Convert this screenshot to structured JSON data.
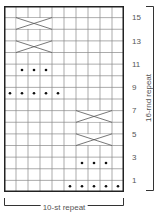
{
  "chart": {
    "columns": 10,
    "rows": 16,
    "grid_color": "#888888",
    "border_color": "#222222",
    "row_labels": [
      "15",
      "13",
      "11",
      "9",
      "7",
      "5",
      "3",
      "1"
    ],
    "purl_symbol": "dot",
    "cable_symbol": "crossing-lines",
    "purls": [
      {
        "row": 11,
        "cols": [
          2,
          3,
          4
        ]
      },
      {
        "row": 9,
        "cols": [
          1,
          2,
          3,
          4,
          5
        ]
      },
      {
        "row": 3,
        "cols": [
          7,
          8,
          9
        ]
      },
      {
        "row": 1,
        "cols": [
          6,
          7,
          8,
          9,
          10
        ]
      }
    ],
    "cables": [
      {
        "row": 15,
        "start_col": 2,
        "span": 3
      },
      {
        "row": 13,
        "start_col": 2,
        "span": 3
      },
      {
        "row": 7,
        "start_col": 7,
        "span": 3
      },
      {
        "row": 5,
        "start_col": 7,
        "span": 3
      }
    ]
  },
  "labels": {
    "vertical_repeat": "16-rnd repeat",
    "horizontal_repeat": "10-st repeat"
  }
}
